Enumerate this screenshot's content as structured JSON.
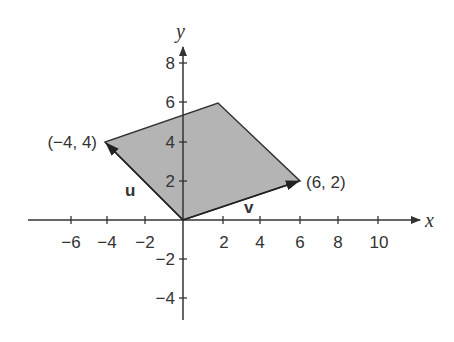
{
  "diagram": {
    "type": "parallelogram-vectors",
    "axes": {
      "x_label": "x",
      "y_label": "y",
      "x_ticks": [
        "−6",
        "−4",
        "−2",
        "2",
        "4",
        "6",
        "8",
        "10"
      ],
      "y_ticks": [
        "8",
        "6",
        "4",
        "2",
        "−2",
        "−4"
      ]
    },
    "vectors": {
      "u": {
        "label": "u",
        "endpoint": [
          -4,
          4
        ]
      },
      "v": {
        "label": "v",
        "endpoint": [
          6,
          2
        ]
      }
    },
    "points": {
      "u_end": "(−4, 4)",
      "v_end": "(6, 2)"
    },
    "parallelogram_vertices": [
      [
        0,
        0
      ],
      [
        -4,
        4
      ],
      [
        2,
        6
      ],
      [
        6,
        2
      ]
    ],
    "colors": {
      "fill": "#b4b4b4",
      "stroke": "#333333"
    }
  }
}
